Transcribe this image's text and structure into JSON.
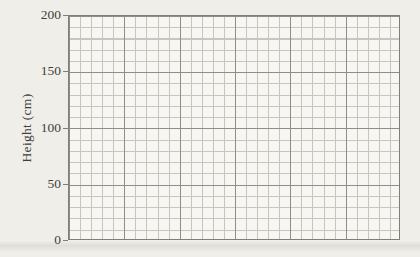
{
  "chart_data": {
    "type": "line",
    "title": "",
    "xlabel": "",
    "ylabel": "Height (cm)",
    "ylim": [
      0,
      200
    ],
    "yticks": [
      0,
      50,
      100,
      150,
      200
    ],
    "xticks": [],
    "series": [],
    "grid": true,
    "grid_minor_cells_per_major": 5,
    "x_major_divisions": 6,
    "y_major_divisions": 4,
    "legend_position": "none"
  },
  "colors": {
    "paper": "#f0eee9",
    "plot_background": "#f7f6f2",
    "grid_minor": "#c7c5c0",
    "grid_major": "#8f8d88",
    "frame": "#807e79",
    "text": "#403e3b"
  }
}
